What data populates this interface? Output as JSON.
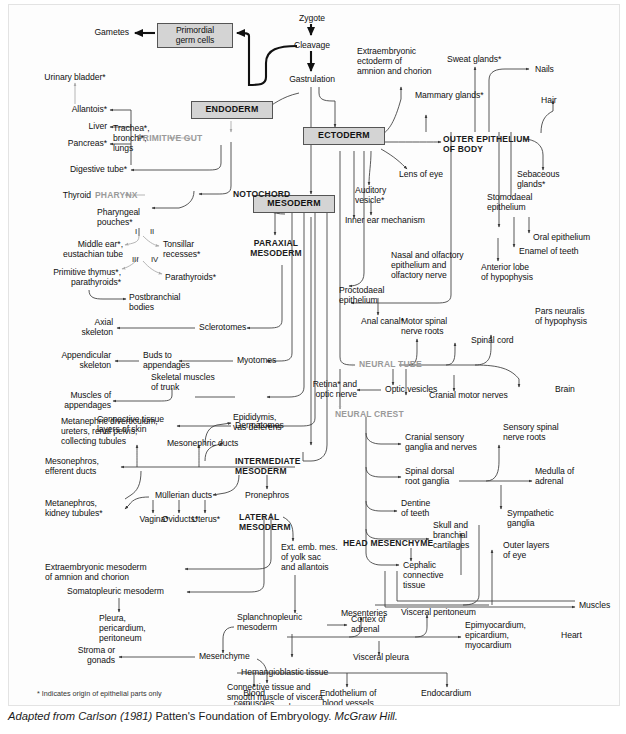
{
  "figure": {
    "footnote": "* Indicates origin of epithelial parts only",
    "caption_italic_1": "Adapted from Carlson (1981)",
    "caption_plain": " Patten's Foundation of Embryology. ",
    "caption_italic_2": "McGraw Hill.",
    "colors": {
      "box_fill": "#d4d4d4",
      "box_border": "#555555",
      "grey_label": "#9a9a9a",
      "arrow_thick": "#111111",
      "arrow_thin": "#3a3a3a",
      "background": "#fdfdfd"
    }
  },
  "stages": {
    "zygote": "Zygote",
    "cleavage": "Cleavage",
    "gastrulation": "Gastrulation",
    "primordial_germ_cells": "Primordial\ngerm cells",
    "gametes": "Gametes"
  },
  "layers": {
    "endoderm": "ENDODERM",
    "ectoderm": "ECTODERM",
    "mesoderm": "MESODERM"
  },
  "endoderm_branch": {
    "primitive_gut": "PRIMITIVE GUT",
    "pharynx": "PHARYNX",
    "trachea": "Trachea*,\nbronchi*,\nlungs",
    "digestive_tube": "Digestive tube*",
    "allantois": "Allantois*",
    "liver": "Liver",
    "pancreas": "Pancreas*",
    "urinary_bladder": "Urinary bladder*",
    "thyroid": "Thyroid",
    "pharyngeal_pouches": "Pharyngeal\npouches*",
    "pouch_1": "I",
    "pouch_2": "II",
    "pouch_3": "III",
    "pouch_4": "IV",
    "middle_ear": "Middle ear*,\neustachian tube",
    "tonsillar": "Tonsillar\nrecesses*",
    "thymus": "Primitive thymus*,\nparathyroids*",
    "parathyroids": "Parathyroids*",
    "postbranchial": "Postbranchial\nbodies"
  },
  "ectoderm_branch": {
    "extraembryonic_ectoderm": "Extraembryonic\nectoderm of\namnion and chorion",
    "mammary": "Mammary glands*",
    "outer_epithelium": "OUTER EPITHELIUM\nOF BODY",
    "sweat": "Sweat glands*",
    "nails": "Nails",
    "hair": "Hair",
    "sebaceous": "Sebaceous\nglands*",
    "stomodaeal": "Stomodaeal\nepithelium",
    "oral_epithelium": "Oral epithelium",
    "enamel": "Enamel of teeth",
    "anterior_lobe": "Anterior lobe\nof hypophysis",
    "lens": "Lens of eye",
    "auditory": "Auditory\nvesicle*",
    "inner_ear": "Inner ear mechanism",
    "nasal": "Nasal and olfactory\nepithelium and\nolfactory nerve",
    "proctodaeal": "Proctodaeal\nepithelium",
    "anal_canal": "Anal canal*"
  },
  "neural": {
    "neural_tube": "NEURAL TUBE",
    "motor_roots": "Motor spinal\nnerve roots",
    "spinal_cord": "Spinal cord",
    "pars_neuralis": "Pars neuralis\nof hypophysis",
    "retina": "Retina* and\noptic nerve",
    "optic_vesicles": "Optic vesicles",
    "brain": "Brain",
    "cranial_motor": "Cranial motor nerves",
    "neural_crest": "NEURAL CREST",
    "cranial_sensory": "Cranial sensory\nganglia and nerves",
    "sensory_spinal": "Sensory spinal\nnerve roots",
    "spinal_dorsal": "Spinal dorsal\nroot ganglia",
    "medulla_adrenal": "Medulla of\nadrenal",
    "dentine": "Dentine\nof teeth",
    "sympathetic": "Sympathetic\nganglia",
    "skull": "Skull and\nbranchial\ncartilages",
    "outer_layers_eye": "Outer layers\nof eye",
    "head_mesenchyme": "HEAD MESENCHYME",
    "cephalic": "Cephalic\nconnective\ntissue"
  },
  "mesoderm_branch": {
    "notochord": "NOTOCHORD",
    "paraxial": "PARAXIAL\nMESODERM",
    "sclerotomes": "Sclerotomes",
    "axial_skeleton": "Axial\nskeleton",
    "myotomes": "Myotomes",
    "buds": "Buds to\nappendages",
    "appendicular": "Appendicular\nskeleton",
    "skeletal_muscles": "Skeletal muscles\nof trunk",
    "muscles_appendages": "Muscles of\nappendages",
    "dermatomes": "Dermatomes",
    "connective_skin": "Connective tissue\nlayers of skin",
    "intermediate": "INTERMEDIATE\nMESODERM",
    "mesonephric_ducts": "Mesonephric ducts",
    "epididymis": "Epididymis,\nvas deferens",
    "metanephric_div": "Metanephric diverticulum,\nureters, renal pelvis,\ncollecting tubules",
    "mesonephros": "Mesonephros,\nefferent ducts",
    "metanephros": "Metanephros,\nkidney tubules*",
    "mullerian": "Müllerian ducts",
    "vagina": "Vagina*",
    "oviducts": "Oviducts*",
    "uterus": "Uterus*",
    "pronephros": "Pronephros",
    "lateral": "LATERAL\nMESODERM",
    "ext_emb_mes": "Ext. emb. mes.\nof yolk sac\nand allantois",
    "extraembryonic_mesoderm": "Extraembryonic mesoderm\nof amnion and chorion",
    "somatopleuric": "Somatopleuric mesoderm",
    "pleura": "Pleura,\npericardium,\nperitoneum",
    "splanchnopleuric": "Splanchnopleuric\nmesoderm",
    "cortex_adrenal": "Cortex of\nadrenal",
    "mesenchyme": "Mesenchyme",
    "stroma": "Stroma or\ngonads",
    "hemangioblastic": "Hemangioblastic tissue",
    "connective_viscera": "Connective tissue and\nsmooth muscle of viscera\nand blood vessels",
    "blood_corpuscles": "Blood\ncorpuscles",
    "endothelium": "Endothelium of\nblood vessels",
    "endocardium": "Endocardium",
    "mesenteries": "Mesenteries",
    "visceral_peritoneum": "Visceral peritoneum",
    "epimyocardium": "Epimyocardium,\nepicardium,\nmyocardium",
    "heart": "Heart",
    "visceral_pleura": "Visceral pleura",
    "muscles": "Muscles"
  }
}
